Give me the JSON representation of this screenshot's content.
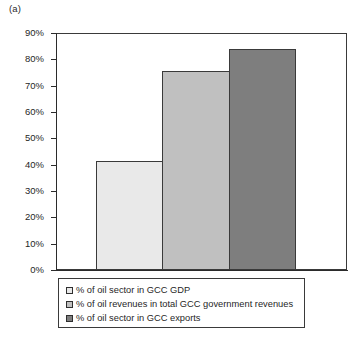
{
  "panel": {
    "label": "(a)"
  },
  "chart_data": {
    "type": "bar",
    "title": "",
    "subtitle": "",
    "xlabel": "",
    "ylabel": "",
    "categories": [
      "% of oil sector in GCC GDP",
      "% of oil revenues in total GCC government revenues",
      "% of oil sector in GCC exports"
    ],
    "values": [
      41.5,
      75.5,
      84.0
    ],
    "value_labels": [
      "41.5%",
      "75.5%",
      "84.0%"
    ],
    "ylim": [
      0,
      90
    ],
    "ytick_labels": [
      "90%",
      "80%",
      "70%",
      "60%",
      "50%",
      "40%",
      "30%",
      "20%",
      "10%",
      "0%"
    ],
    "ytick_values": [
      90,
      80,
      70,
      60,
      50,
      40,
      30,
      20,
      10,
      0
    ],
    "xtick_labels": [],
    "grid": false,
    "legend_position": "bottom",
    "series_colors": [
      "#e9e9e9",
      "#c0c0c0",
      "#7e7e7e"
    ],
    "bar_border_color": "#3a3a3a",
    "axis_color": "#2b2b2b",
    "background": "#ffffff"
  },
  "legend": {
    "items": [
      {
        "swatch": "#e9e9e9",
        "label": "% of oil sector in GCC GDP"
      },
      {
        "swatch": "#c0c0c0",
        "label": "% of oil revenues in total GCC government revenues"
      },
      {
        "swatch": "#7e7e7e",
        "label": "% of oil sector in GCC exports"
      }
    ]
  }
}
